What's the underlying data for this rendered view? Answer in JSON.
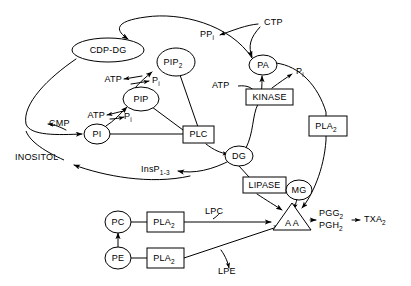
{
  "diagram": {
    "background_color": "#ffffff",
    "line_color": "#000000",
    "text_color": "#000000",
    "nodes": [
      {
        "id": "cdp-dg",
        "label": "CDP-DG",
        "shape": "ellipse",
        "x": 108,
        "y": 50
      },
      {
        "id": "pip2",
        "label": "PIP",
        "sub": "2",
        "shape": "ellipse",
        "x": 176,
        "y": 62
      },
      {
        "id": "pip",
        "label": "PIP",
        "shape": "ellipse",
        "x": 141,
        "y": 99
      },
      {
        "id": "pi",
        "label": "PI",
        "shape": "ellipse",
        "x": 97,
        "y": 134
      },
      {
        "id": "plc",
        "label": "PLC",
        "shape": "rectangle",
        "x": 198,
        "y": 135
      },
      {
        "id": "dg",
        "label": "DG",
        "shape": "ellipse",
        "x": 239,
        "y": 156
      },
      {
        "id": "pa",
        "label": "PA",
        "shape": "ellipse",
        "x": 263,
        "y": 65
      },
      {
        "id": "kinase",
        "label": "KINASE",
        "shape": "rectangle",
        "x": 269,
        "y": 97
      },
      {
        "id": "pla2-right",
        "label": "PLA",
        "sub": "2",
        "shape": "rectangle",
        "x": 328,
        "y": 126
      },
      {
        "id": "lipase",
        "label": "LIPASE",
        "shape": "rectangle",
        "x": 262,
        "y": 185
      },
      {
        "id": "mg",
        "label": "MG",
        "shape": "ellipse",
        "x": 299,
        "y": 190
      },
      {
        "id": "aa",
        "label": "A A",
        "shape": "triangle",
        "x": 292,
        "y": 220
      },
      {
        "id": "pc",
        "label": "PC",
        "shape": "ellipse",
        "x": 118,
        "y": 222
      },
      {
        "id": "pla2-pc",
        "label": "PLA",
        "sub": "2",
        "shape": "rectangle",
        "x": 165,
        "y": 222
      },
      {
        "id": "pe",
        "label": "PE",
        "shape": "ellipse",
        "x": 118,
        "y": 258
      },
      {
        "id": "pla2-pe",
        "label": "PLA",
        "sub": "2",
        "shape": "rectangle",
        "x": 165,
        "y": 258
      }
    ],
    "labels": [
      {
        "id": "ctp",
        "text": "CTP",
        "x": 264,
        "y": 23,
        "anchor": "start"
      },
      {
        "id": "ppi",
        "text": "PP",
        "sub": "i",
        "x": 200,
        "y": 35,
        "anchor": "start"
      },
      {
        "id": "atp-pip2",
        "text": "ATP",
        "x": 122,
        "y": 80,
        "anchor": "end"
      },
      {
        "id": "pi-pip2",
        "text": "P",
        "sub": "i",
        "x": 152,
        "y": 81,
        "anchor": "start"
      },
      {
        "id": "atp-pip",
        "text": "ATP",
        "x": 105,
        "y": 116,
        "anchor": "end"
      },
      {
        "id": "pi-pip",
        "text": "P",
        "sub": "i",
        "x": 124,
        "y": 117,
        "anchor": "start"
      },
      {
        "id": "atp-pa",
        "text": "ATP",
        "x": 223,
        "y": 86,
        "anchor": "start"
      },
      {
        "id": "pi-pa",
        "text": "P",
        "sub": "i",
        "x": 296,
        "y": 72,
        "anchor": "start"
      },
      {
        "id": "cmp",
        "text": "CMP",
        "x": 45,
        "y": 124,
        "anchor": "start"
      },
      {
        "id": "inositol",
        "text": "INOSITOL",
        "x": 15,
        "y": 158,
        "anchor": "start"
      },
      {
        "id": "insp",
        "text": "InsP",
        "sub": "1-3",
        "x": 141,
        "y": 170,
        "anchor": "start"
      },
      {
        "id": "lpc",
        "text": "LPC",
        "x": 205,
        "y": 212,
        "anchor": "start"
      },
      {
        "id": "lpe",
        "text": "LPE",
        "x": 218,
        "y": 272,
        "anchor": "start"
      },
      {
        "id": "pgg2",
        "text": "PGG",
        "sub": "2",
        "x": 320,
        "y": 214,
        "anchor": "start"
      },
      {
        "id": "pgh2",
        "text": "PGH",
        "sub": "2",
        "x": 320,
        "y": 226,
        "anchor": "start"
      },
      {
        "id": "txa2",
        "text": "TXA",
        "sub": "2",
        "x": 364,
        "y": 220,
        "anchor": "start"
      }
    ],
    "edges": [
      {
        "id": "ctp-to-pa",
        "from": "CTP",
        "to": "PA"
      },
      {
        "id": "ctp-to-ppi",
        "from": "CTP",
        "to": "PPi"
      },
      {
        "id": "pa-to-cdpdg",
        "from": "PA",
        "to": "CDP-DG"
      },
      {
        "id": "cdpdg-to-pi",
        "from": "CDP-DG",
        "to": "PI"
      },
      {
        "id": "cdpdg-to-cmp",
        "from": "CDP-DG",
        "to": "CMP"
      },
      {
        "id": "pi-to-pip",
        "from": "PI",
        "to": "PIP"
      },
      {
        "id": "pip-to-pip2",
        "from": "PIP",
        "to": "PIP2"
      },
      {
        "id": "pip2-to-plc",
        "from": "PIP2",
        "to": "PLC"
      },
      {
        "id": "pip-to-plc",
        "from": "PIP",
        "to": "PLC"
      },
      {
        "id": "pi-to-plc",
        "from": "PI",
        "to": "PLC"
      },
      {
        "id": "plc-to-dg",
        "from": "PLC",
        "to": "DG"
      },
      {
        "id": "plc-to-insp",
        "from": "PLC",
        "to": "InsP1-3"
      },
      {
        "id": "insp-to-inositol",
        "from": "InsP1-3",
        "to": "INOSITOL"
      },
      {
        "id": "dg-to-kinase-pa",
        "from": "DG",
        "to": "PA"
      },
      {
        "id": "kinase-to-pa",
        "from": "KINASE",
        "to": "PA"
      },
      {
        "id": "atp-to-kinase",
        "from": "ATP",
        "to": "KINASE"
      },
      {
        "id": "kinase-to-pi",
        "from": "KINASE",
        "to": "Pi"
      },
      {
        "id": "pa-to-pla2-aa",
        "from": "PA",
        "to": "AA"
      },
      {
        "id": "dg-to-lipase",
        "from": "DG",
        "to": "LIPASE"
      },
      {
        "id": "lipase-to-aa",
        "from": "LIPASE",
        "to": "AA"
      },
      {
        "id": "lipase-to-mg",
        "from": "LIPASE",
        "to": "MG"
      },
      {
        "id": "mg-to-aa",
        "from": "MG",
        "to": "AA"
      },
      {
        "id": "pe-to-pc",
        "from": "PE",
        "to": "PC"
      },
      {
        "id": "pc-to-pla2",
        "from": "PC",
        "to": "PLA2"
      },
      {
        "id": "pla2pc-to-aa",
        "from": "PLA2",
        "to": "AA"
      },
      {
        "id": "pe-to-pla2",
        "from": "PE",
        "to": "PLA2"
      },
      {
        "id": "pla2pe-to-aa",
        "from": "PLA2",
        "to": "AA"
      },
      {
        "id": "aa-to-pg",
        "from": "AA",
        "to": "PGG2/PGH2"
      },
      {
        "id": "pg-to-txa2",
        "from": "PGG2/PGH2",
        "to": "TXA2"
      }
    ]
  }
}
